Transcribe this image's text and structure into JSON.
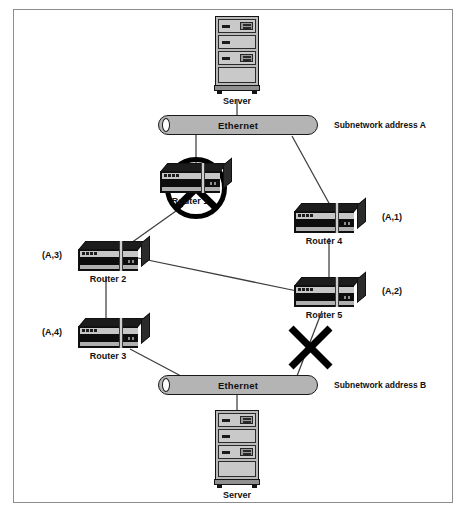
{
  "diagram": {
    "background": "#ffffff",
    "border_color": "#8d8d8d"
  },
  "servers": [
    {
      "id": "server-top",
      "label": "Server",
      "x": 207,
      "y": 16
    },
    {
      "id": "server-bottom",
      "label": "Server",
      "x": 207,
      "y": 404
    }
  ],
  "buses": [
    {
      "id": "ethernet-a",
      "label": "Ethernet",
      "x": 158,
      "y": 115,
      "width": 160,
      "address_label": "Subnetwork address A",
      "address_x": 334,
      "address_y": 121
    },
    {
      "id": "ethernet-b",
      "label": "Ethernet",
      "x": 158,
      "y": 375,
      "width": 160,
      "address_label": "Subnetwork address B",
      "address_x": 334,
      "address_y": 381
    }
  ],
  "routers": [
    {
      "id": "router-1",
      "label": "Router 1",
      "x": 160,
      "y": 163,
      "addr": null,
      "addr_x": null,
      "addr_y": null,
      "failed": true
    },
    {
      "id": "router-4",
      "label": "Router 4",
      "x": 294,
      "y": 203,
      "addr": "(A,1)",
      "addr_x": 382,
      "addr_y": 213,
      "failed": false
    },
    {
      "id": "router-2",
      "label": "Router 2",
      "x": 78,
      "y": 241,
      "addr": "(A,3)",
      "addr_x": 42,
      "addr_y": 251,
      "failed": false
    },
    {
      "id": "router-5",
      "label": "Router 5",
      "x": 294,
      "y": 277,
      "addr": "(A,2)",
      "addr_x": 382,
      "addr_y": 287,
      "failed": false
    },
    {
      "id": "router-3",
      "label": "Router 3",
      "x": 78,
      "y": 318,
      "addr": "(A,4)",
      "addr_x": 42,
      "addr_y": 328,
      "failed": false
    }
  ],
  "links": [
    {
      "id": "link-server-top-bus-a",
      "from": "server-top",
      "to": "ethernet-a",
      "x1": 237,
      "y1": 100,
      "x2": 237,
      "y2": 115,
      "broken": false
    },
    {
      "id": "link-bus-a-router-1",
      "from": "ethernet-a",
      "to": "router-1",
      "x1": 196,
      "y1": 135,
      "x2": 196,
      "y2": 166,
      "broken": false
    },
    {
      "id": "link-bus-a-router-4",
      "from": "ethernet-a",
      "to": "router-4",
      "x1": 294,
      "y1": 135,
      "x2": 330,
      "y2": 204,
      "broken": false
    },
    {
      "id": "link-router-1-router-2",
      "from": "router-1",
      "to": "router-2",
      "x1": 183,
      "y1": 205,
      "x2": 131,
      "y2": 243,
      "broken": false
    },
    {
      "id": "link-router-4-router-5",
      "from": "router-4",
      "to": "router-5",
      "x1": 329,
      "y1": 237,
      "x2": 329,
      "y2": 279,
      "broken": false
    },
    {
      "id": "link-router-2-router-5",
      "from": "router-2",
      "to": "router-5",
      "x1": 138,
      "y1": 258,
      "x2": 296,
      "y2": 290,
      "broken": false
    },
    {
      "id": "link-router-2-router-3",
      "from": "router-2",
      "to": "router-3",
      "x1": 106,
      "y1": 275,
      "x2": 106,
      "y2": 320,
      "broken": false
    },
    {
      "id": "link-router-3-bus-b",
      "from": "router-3",
      "to": "ethernet-b",
      "x1": 130,
      "y1": 348,
      "x2": 180,
      "y2": 375,
      "broken": false
    },
    {
      "id": "link-router-5-bus-b",
      "from": "router-5",
      "to": "ethernet-b",
      "x1": 322,
      "y1": 310,
      "x2": 297,
      "y2": 375,
      "broken": true
    },
    {
      "id": "link-bus-b-server-bottom",
      "from": "ethernet-b",
      "to": "server-bottom",
      "x1": 237,
      "y1": 395,
      "x2": 237,
      "y2": 410,
      "broken": false
    }
  ],
  "failure_markers": [
    {
      "id": "router-1-failure",
      "type": "circled-cross",
      "target": "router-1",
      "cx": 196,
      "cy": 188,
      "r": 30
    },
    {
      "id": "link-router-5-failure",
      "type": "cross",
      "target": "link-router-5-bus-b",
      "cx": 310,
      "cy": 347,
      "size": 21
    }
  ],
  "colors": {
    "bus_fill": "#b4b4b4",
    "router_body": "#0d0d0d",
    "router_band": "#c6c6c6",
    "server_fill": "#b9b9b9",
    "line": "#3d3d3d",
    "failure": "#000000"
  }
}
